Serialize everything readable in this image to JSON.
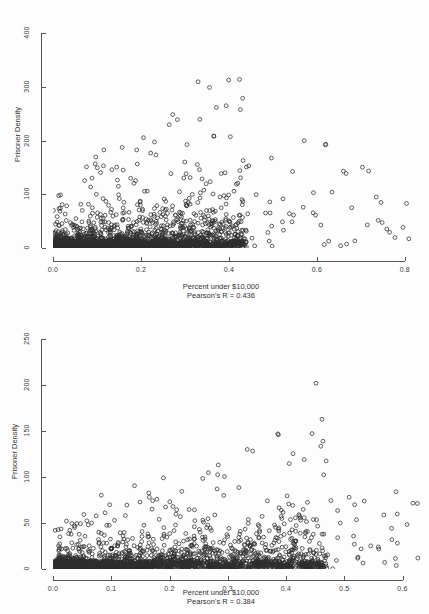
{
  "figure": {
    "background_color": "#fdfdfd",
    "marker_color": "#2e2e2e",
    "axis_color": "#555555"
  },
  "chart_data": [
    {
      "id": "chart-top",
      "type": "scatter",
      "title": "",
      "xlabel": "Percent under $10,000",
      "ylabel": "Prisoner Density",
      "annotation": "Pearson's R = 0.436",
      "pearson_r": 0.436,
      "xlim": [
        0.0,
        0.83
      ],
      "ylim": [
        0,
        440
      ],
      "xticks": [
        0.0,
        0.2,
        0.4,
        0.6,
        0.8
      ],
      "xticklabels": [
        "0.0",
        "0.2",
        "0.4",
        "0.6",
        "0.8"
      ],
      "yticks": [
        0,
        100,
        200,
        300,
        400
      ],
      "yticklabels": [
        "0",
        "100",
        "200",
        "300",
        "400"
      ],
      "grid": false,
      "legend": false,
      "marker": "open-circle",
      "n_points": 2400,
      "description": "Dense saturated cloud of open circles hugging the x-axis from 0.0 to about 0.42, fanning upward; sparse high-density outliers scattered up to ~430 between x 0.1 and 0.55; isolated low points extend right to x ~0.82."
    },
    {
      "id": "chart-bottom",
      "type": "scatter",
      "title": "",
      "xlabel": "Percent under $10,000",
      "ylabel": "Prisoner Density",
      "annotation": "Pearson's R = 0.384",
      "pearson_r": 0.384,
      "xlim": [
        0.0,
        0.63
      ],
      "ylim": [
        0,
        265
      ],
      "xticks": [
        0.0,
        0.1,
        0.2,
        0.3,
        0.4,
        0.5,
        0.6
      ],
      "xticklabels": [
        "0.0",
        "0.1",
        "0.2",
        "0.3",
        "0.4",
        "0.5",
        "0.6"
      ],
      "yticks": [
        0,
        50,
        100,
        150,
        200,
        250
      ],
      "yticklabels": [
        "0",
        "50",
        "100",
        "150",
        "200",
        "250"
      ],
      "grid": false,
      "legend": false,
      "marker": "open-circle",
      "n_points": 2200,
      "description": "Heavy black band of overlapping open circles along the baseline from 0.0 to about 0.45, thinning upward; mid-density scatter to ~120; sparse outliers up to ~250 near x 0.3; few far-right points to x ~0.6."
    }
  ],
  "footer": {
    "cut_off_text": ""
  }
}
